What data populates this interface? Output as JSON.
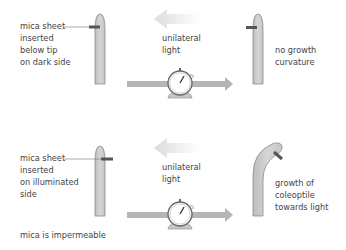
{
  "panels": [
    {
      "label_lines": [
        "mica sheet",
        "inserted",
        "below tip",
        "on dark side"
      ],
      "light_label": [
        "unilateral",
        "light"
      ],
      "result_lines": [
        "no growth",
        "curvature"
      ]
    },
    {
      "label_lines": [
        "mica sheet",
        "inserted",
        "on illuminated",
        "side"
      ],
      "light_label": [
        "unilateral",
        "light"
      ],
      "result_lines": [
        "growth of",
        "coleoptile",
        "towards light"
      ]
    }
  ],
  "footnote": "mica is impermeable",
  "colors": {
    "coleoptile_fill": "#cfcfcf",
    "coleoptile_stroke": "#8a8a8a",
    "mica": "#555555",
    "arrow": "#b5b5b5",
    "light_arrow": "#e6e6e6"
  }
}
